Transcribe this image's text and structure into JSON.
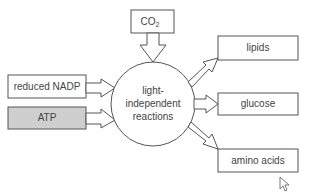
{
  "diagram": {
    "center": {
      "line1": "light-",
      "line2": "independent",
      "line3": "reactions"
    },
    "inputs": [
      {
        "label": "reduced NADP",
        "shaded": false
      },
      {
        "label": "ATP",
        "shaded": true
      }
    ],
    "top_input": {
      "label": "CO",
      "subscript": "2"
    },
    "outputs": [
      {
        "label": "lipids"
      },
      {
        "label": "glucose"
      },
      {
        "label": "amino acids"
      }
    ],
    "colors": {
      "stroke": "#555555",
      "shaded_fill": "#cfcfcf",
      "text": "#444444"
    }
  }
}
